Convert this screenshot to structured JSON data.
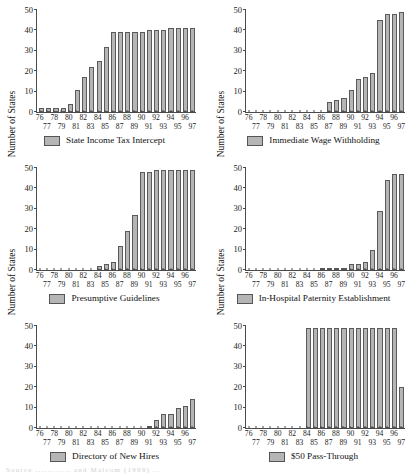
{
  "figure": {
    "axis_label_y": "Number of States",
    "y_ticks": [
      0,
      10,
      20,
      30,
      40,
      50
    ],
    "x_ticks_row1": [
      "76",
      "78",
      "80",
      "82",
      "84",
      "86",
      "88",
      "90",
      "92",
      "94",
      "96"
    ],
    "x_ticks_row2": [
      "77",
      "79",
      "81",
      "83",
      "85",
      "87",
      "89",
      "91",
      "93",
      "95",
      "97"
    ],
    "bar_color": "#b5b5b5",
    "bar_border_color": "#5a5a5a",
    "axis_color": "#4a4a4a",
    "caption": "Source  ............  and Malcom  (1999)  ..."
  },
  "chart_data": [
    {
      "type": "bar",
      "title": "State Income Tax Intercept",
      "legend": "State Income Tax Intercept",
      "xlabel": "",
      "ylabel": "Number of States",
      "ylim": [
        0,
        50
      ],
      "grid": false,
      "legend_position": "bottom-center",
      "categories": [
        "76",
        "77",
        "78",
        "79",
        "80",
        "81",
        "82",
        "83",
        "84",
        "85",
        "86",
        "87",
        "88",
        "89",
        "90",
        "91",
        "92",
        "93",
        "94",
        "95",
        "96",
        "97"
      ],
      "values": [
        2,
        2,
        2,
        2,
        4,
        11,
        17,
        22,
        25,
        32,
        39,
        39,
        39,
        39,
        39,
        40,
        40,
        40,
        41,
        41,
        41,
        41
      ]
    },
    {
      "type": "bar",
      "title": "Immediate Wage Withholding",
      "legend": "Immediate Wage Withholding",
      "xlabel": "",
      "ylabel": "Number of States",
      "ylim": [
        0,
        50
      ],
      "grid": false,
      "legend_position": "bottom-center",
      "categories": [
        "76",
        "77",
        "78",
        "79",
        "80",
        "81",
        "82",
        "83",
        "84",
        "85",
        "86",
        "87",
        "88",
        "89",
        "90",
        "91",
        "92",
        "93",
        "94",
        "95",
        "96",
        "97"
      ],
      "values": [
        0,
        0,
        0,
        0,
        0,
        0,
        0,
        0,
        0,
        0,
        0,
        5,
        6,
        7,
        11,
        16,
        17,
        19,
        45,
        48,
        48,
        49
      ]
    },
    {
      "type": "bar",
      "title": "Presumptive Guidelines",
      "legend": "Presumptive Guidelines",
      "xlabel": "",
      "ylabel": "Number of States",
      "ylim": [
        0,
        50
      ],
      "grid": false,
      "legend_position": "bottom-center",
      "categories": [
        "76",
        "77",
        "78",
        "79",
        "80",
        "81",
        "82",
        "83",
        "84",
        "85",
        "86",
        "87",
        "88",
        "89",
        "90",
        "91",
        "92",
        "93",
        "94",
        "95",
        "96",
        "97"
      ],
      "values": [
        0,
        0,
        0,
        0,
        0,
        0,
        0,
        0,
        2,
        3,
        4,
        12,
        19,
        27,
        48,
        48,
        49,
        49,
        49,
        49,
        49,
        49
      ]
    },
    {
      "type": "bar",
      "title": "In-Hospital Paternity Establishment",
      "legend": "In-Hospital Paternity Establishment",
      "xlabel": "",
      "ylabel": "Number of States",
      "ylim": [
        0,
        50
      ],
      "grid": false,
      "legend_position": "bottom-center",
      "categories": [
        "76",
        "77",
        "78",
        "79",
        "80",
        "81",
        "82",
        "83",
        "84",
        "85",
        "86",
        "87",
        "88",
        "89",
        "90",
        "91",
        "92",
        "93",
        "94",
        "95",
        "96",
        "97"
      ],
      "values": [
        0,
        0,
        0,
        0,
        0,
        0,
        0,
        0,
        0,
        0,
        1,
        1,
        1,
        1,
        3,
        3,
        4,
        10,
        29,
        44,
        47,
        47
      ]
    },
    {
      "type": "bar",
      "title": "Directory of New Hires",
      "legend": "Directory of New Hires",
      "xlabel": "",
      "ylabel": "Number of States",
      "ylim": [
        0,
        50
      ],
      "grid": false,
      "legend_position": "bottom-center",
      "categories": [
        "76",
        "77",
        "78",
        "79",
        "80",
        "81",
        "82",
        "83",
        "84",
        "85",
        "86",
        "87",
        "88",
        "89",
        "90",
        "91",
        "92",
        "93",
        "94",
        "95",
        "96",
        "97"
      ],
      "values": [
        0,
        0,
        0,
        0,
        0,
        0,
        0,
        0,
        0,
        0,
        0,
        0,
        0,
        0,
        0,
        1,
        4,
        7,
        7,
        10,
        11,
        14
      ]
    },
    {
      "type": "bar",
      "title": "$50 Pass-Through",
      "legend": "$50 Pass-Through",
      "xlabel": "",
      "ylabel": "Number of States",
      "ylim": [
        0,
        50
      ],
      "grid": false,
      "legend_position": "bottom-center",
      "categories": [
        "76",
        "77",
        "78",
        "79",
        "80",
        "81",
        "82",
        "83",
        "84",
        "85",
        "86",
        "87",
        "88",
        "89",
        "90",
        "91",
        "92",
        "93",
        "94",
        "95",
        "96",
        "97"
      ],
      "values": [
        0,
        0,
        0,
        0,
        0,
        0,
        0,
        0,
        49,
        49,
        49,
        49,
        49,
        49,
        49,
        49,
        49,
        49,
        49,
        49,
        49,
        20
      ]
    }
  ]
}
